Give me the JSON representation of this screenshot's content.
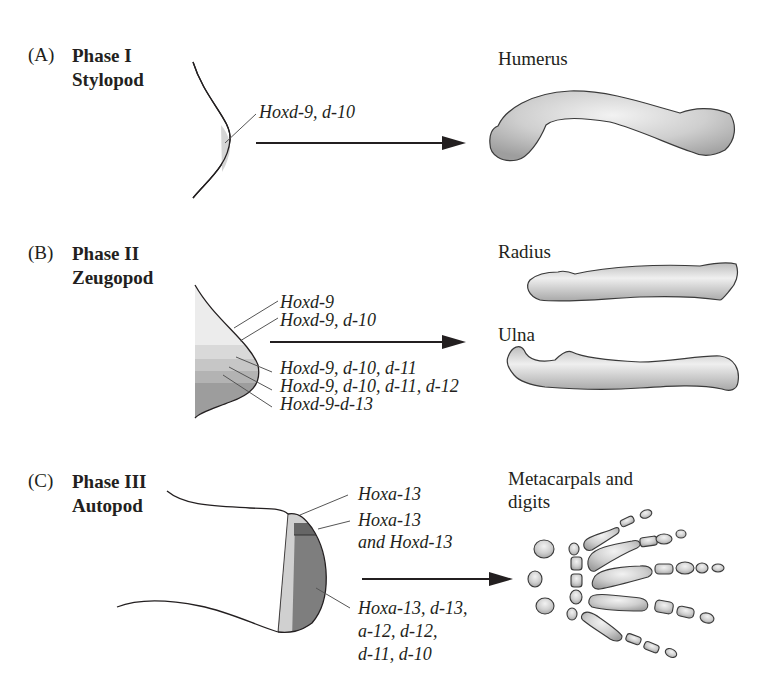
{
  "colors": {
    "ink": "#231f20",
    "bone_fill": "#c8c8c8",
    "bone_highlight": "#eeeeee",
    "zone_lightest": "#ececec",
    "zone_light": "#d9d9d9",
    "zone_mid": "#c2c2c2",
    "zone_dark": "#a9a9a9",
    "zone_darkest": "#8a8a8a",
    "autopod_strip": "#cfcfcf",
    "autopod_band": "#6e6e6e",
    "autopod_main": "#7b7b7b"
  },
  "panels": [
    {
      "letter": "(A)",
      "phase": "Phase I",
      "segment": "Stylopod",
      "genes": [
        "Hoxd-9, d-10"
      ],
      "bones": [
        "Humerus"
      ]
    },
    {
      "letter": "(B)",
      "phase": "Phase II",
      "segment": "Zeugopod",
      "genes": [
        "Hoxd-9",
        "Hoxd-9, d-10",
        "Hoxd-9, d-10, d-11",
        "Hoxd-9, d-10, d-11, d-12",
        "Hoxd-9-d-13"
      ],
      "bones": [
        "Radius",
        "Ulna"
      ]
    },
    {
      "letter": "(C)",
      "phase": "Phase III",
      "segment": "Autopod",
      "genes": [
        "Hoxa-13",
        "Hoxa-13",
        "and Hoxd-13",
        "Hoxa-13, d-13,",
        "a-12, d-12,",
        "d-11, d-10"
      ],
      "bones": [
        "Metacarpals and",
        "digits"
      ]
    }
  ]
}
